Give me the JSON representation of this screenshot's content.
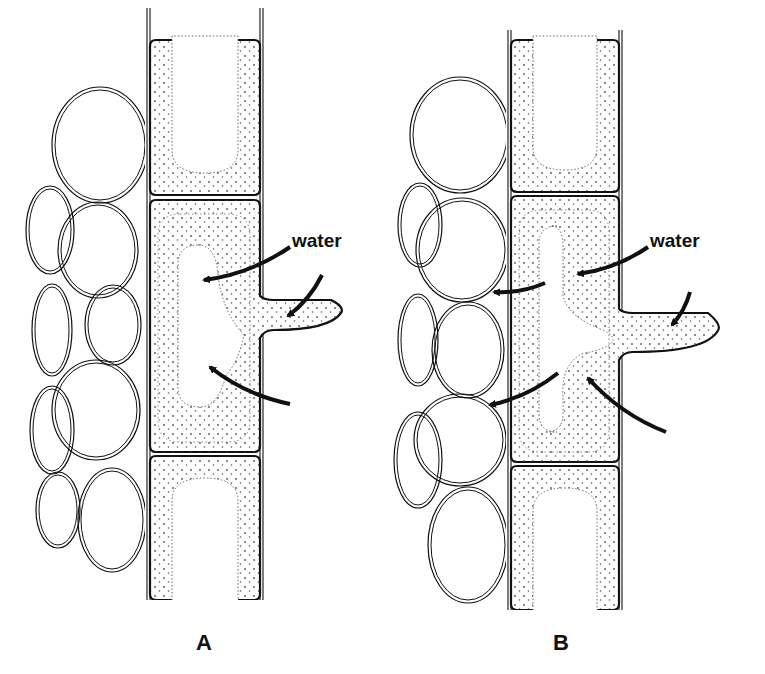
{
  "diagram": {
    "colors": {
      "ink": "#111111",
      "stipple": "#555555",
      "background": "#ffffff"
    },
    "panels": [
      {
        "id": "A",
        "label": "A",
        "label_pos": [
          196,
          642
        ],
        "water_label": "water",
        "water_label_pos": [
          290,
          246
        ],
        "column": {
          "x1": 147,
          "x2": 263,
          "top": 8,
          "bottom": 600
        },
        "cells": [
          {
            "name": "upper-cell",
            "y1": 40,
            "y2": 195
          },
          {
            "name": "root-hair-cell",
            "y1": 200,
            "y2": 452
          },
          {
            "name": "lower-cell",
            "y1": 456,
            "y2": 600
          }
        ],
        "root_hair": {
          "y_top": 296,
          "y_bottom": 330,
          "tip_x": 345
        },
        "cortex_cells": [
          {
            "cx": 100,
            "cy": 145,
            "rx": 48,
            "ry": 58
          },
          {
            "cx": 98,
            "cy": 250,
            "rx": 40,
            "ry": 48
          },
          {
            "cx": 113,
            "cy": 325,
            "rx": 28,
            "ry": 40
          },
          {
            "cx": 96,
            "cy": 410,
            "rx": 44,
            "ry": 50
          },
          {
            "cx": 112,
            "cy": 520,
            "rx": 34,
            "ry": 52
          },
          {
            "cx": 50,
            "cy": 230,
            "rx": 24,
            "ry": 44
          },
          {
            "cx": 52,
            "cy": 330,
            "rx": 20,
            "ry": 46
          },
          {
            "cx": 52,
            "cy": 430,
            "rx": 22,
            "ry": 44
          },
          {
            "cx": 58,
            "cy": 510,
            "rx": 22,
            "ry": 38
          }
        ],
        "arrows": [
          {
            "name": "water-arrow-into-vacuole-upper",
            "from": [
              290,
              247
            ],
            "to": [
              204,
              280
            ]
          },
          {
            "name": "water-arrow-into-root-hair",
            "from": [
              322,
              275
            ],
            "to": [
              288,
              316
            ]
          },
          {
            "name": "water-arrow-into-vacuole-lower",
            "from": [
              290,
              404
            ],
            "to": [
              210,
              367
            ]
          }
        ]
      },
      {
        "id": "B",
        "label": "B",
        "label_pos": [
          553,
          642
        ],
        "water_label": "water",
        "water_label_pos": [
          645,
          246
        ],
        "column": {
          "x1": 508,
          "x2": 622,
          "top": 30,
          "bottom": 610
        },
        "cells": [
          {
            "name": "upper-cell",
            "y1": 40,
            "y2": 192
          },
          {
            "name": "root-hair-cell",
            "y1": 196,
            "y2": 462
          },
          {
            "name": "lower-cell",
            "y1": 466,
            "y2": 610
          }
        ],
        "root_hair": {
          "y_top": 309,
          "y_bottom": 352,
          "tip_x": 722
        },
        "cortex_cells": [
          {
            "cx": 460,
            "cy": 135,
            "rx": 50,
            "ry": 58
          },
          {
            "cx": 462,
            "cy": 250,
            "rx": 46,
            "ry": 52
          },
          {
            "cx": 468,
            "cy": 350,
            "rx": 36,
            "ry": 48
          },
          {
            "cx": 460,
            "cy": 440,
            "rx": 46,
            "ry": 46
          },
          {
            "cx": 468,
            "cy": 545,
            "rx": 40,
            "ry": 58
          },
          {
            "cx": 420,
            "cy": 225,
            "rx": 22,
            "ry": 42
          },
          {
            "cx": 418,
            "cy": 340,
            "rx": 20,
            "ry": 46
          },
          {
            "cx": 418,
            "cy": 460,
            "rx": 24,
            "ry": 48
          }
        ],
        "arrows": [
          {
            "name": "water-arrow-into-vacuole-upper",
            "from": [
              648,
              247
            ],
            "to": [
              578,
              274
            ]
          },
          {
            "name": "water-arrow-into-root-hair",
            "from": [
              690,
              292
            ],
            "to": [
              672,
              325
            ]
          },
          {
            "name": "water-arrow-into-vacuole-lower",
            "from": [
              666,
              432
            ],
            "to": [
              588,
              378
            ]
          },
          {
            "name": "water-arrow-out-to-cortex-upper",
            "from": [
              545,
              283
            ],
            "to": [
              494,
              292
            ]
          },
          {
            "name": "water-arrow-out-to-cortex-lower",
            "from": [
              558,
              373
            ],
            "to": [
              490,
              405
            ]
          }
        ]
      }
    ]
  }
}
